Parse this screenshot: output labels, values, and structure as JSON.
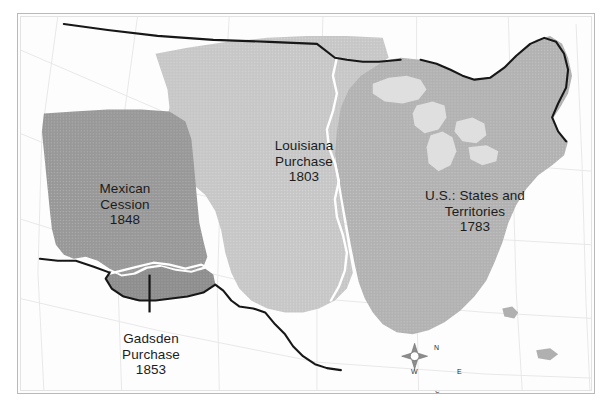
{
  "figure": {
    "background_color": "#ffffff",
    "frame_color": "#b9b9b9"
  },
  "map": {
    "projection_grid": "graticule",
    "palette": {
      "louisiana_purchase_fill": "#c9c9c9",
      "mexican_cession_fill": "#9a9a9a",
      "eastern_states_fill": "#b4b4b4",
      "gadsden_purchase_fill": "#8f8f8f",
      "great_lakes_fill": "#dedede",
      "unorganized_fill": "#ffffff",
      "border_line": "#111111",
      "river_line": "#ffffff",
      "graticule_line": "#e6e6e6"
    },
    "regions": [
      {
        "id": "louisiana-purchase",
        "name": "Louisiana Purchase",
        "label_lines": [
          "Louisiana",
          "Purchase",
          "1803"
        ],
        "year": "1803",
        "fill": "#c9c9c9"
      },
      {
        "id": "mexican-cession",
        "name": "Mexican Cession",
        "label_lines": [
          "Mexican",
          "Cession",
          "1848"
        ],
        "year": "1848",
        "fill": "#9a9a9a"
      },
      {
        "id": "eastern-states",
        "name": "U.S.: States and Territories",
        "label_lines": [
          "U.S.: States and",
          "Territories",
          "1783"
        ],
        "year": "1783",
        "fill": "#b4b4b4"
      },
      {
        "id": "gadsden-purchase",
        "name": "Gadsden Purchase",
        "label_lines": [
          "Gadsden",
          "Purchase",
          "1853"
        ],
        "year": "1853",
        "fill": "#8f8f8f",
        "has_leader_line": true
      }
    ],
    "compass": {
      "north": "N",
      "east": "E",
      "south": "S",
      "west": "W"
    }
  }
}
